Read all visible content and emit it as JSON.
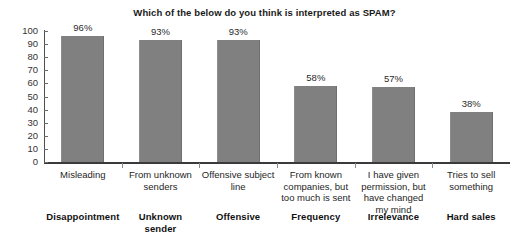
{
  "chart_data": {
    "type": "bar",
    "title": "Which of the below do you think is interpreted as SPAM?",
    "xlabel": "",
    "ylabel": "",
    "ylim": [
      0,
      100
    ],
    "yticks": [
      0,
      10,
      20,
      30,
      40,
      50,
      60,
      70,
      80,
      90,
      100
    ],
    "grid": false,
    "legend": "none",
    "bar_color": "#808080",
    "categories": [
      "Misleading",
      "From unknown senders",
      "Offensive subject line",
      "From known companies, but too much is sent",
      "I have given permission, but have changed my mind",
      "Tries to sell something"
    ],
    "group_labels": [
      "Disappointment",
      "Unknown sender",
      "Offensive",
      "Frequency",
      "Irrelevance",
      "Hard sales"
    ],
    "values": [
      96,
      93,
      93,
      58,
      57,
      38
    ],
    "value_labels": [
      "96%",
      "93%",
      "93%",
      "58%",
      "57%",
      "38%"
    ]
  }
}
